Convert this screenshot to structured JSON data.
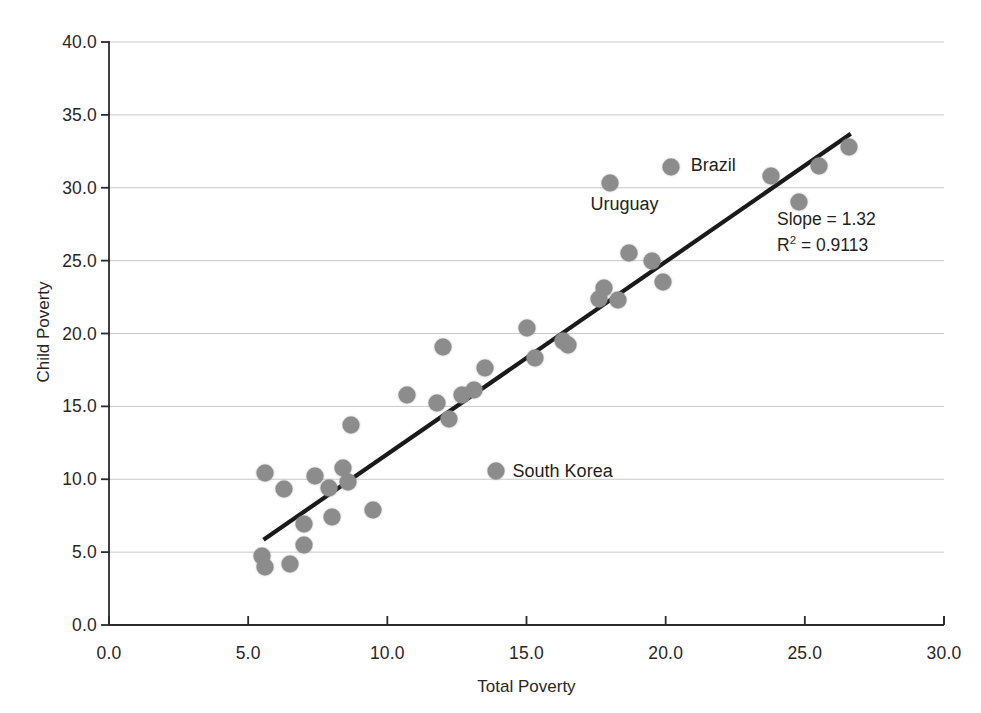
{
  "chart_data": {
    "type": "scatter",
    "title": "",
    "xlabel": "Total Poverty",
    "ylabel": "Child Poverty",
    "xlim": [
      0.0,
      30.0
    ],
    "ylim": [
      0.0,
      40.0
    ],
    "xticks": [
      "0.0",
      "5.0",
      "10.0",
      "15.0",
      "20.0",
      "25.0",
      "30.0"
    ],
    "yticks": [
      "0.0",
      "5.0",
      "10.0",
      "15.0",
      "20.0",
      "25.0",
      "30.0",
      "35.0",
      "40.0"
    ],
    "xtick_values": [
      0,
      5,
      10,
      15,
      20,
      25,
      30
    ],
    "ytick_values": [
      0,
      5,
      10,
      15,
      20,
      25,
      30,
      35,
      40
    ],
    "grid": "horizontal",
    "legend": "none",
    "marker_color": "#8c8c8c",
    "marker_size_px": 17,
    "trendline_color": "#1a1a1a",
    "series": [
      {
        "name": "Countries",
        "points": [
          {
            "x": 5.5,
            "y": 4.7,
            "label": ""
          },
          {
            "x": 5.6,
            "y": 4.0,
            "label": ""
          },
          {
            "x": 5.6,
            "y": 10.4,
            "label": ""
          },
          {
            "x": 6.3,
            "y": 9.3,
            "label": ""
          },
          {
            "x": 6.5,
            "y": 4.2,
            "label": ""
          },
          {
            "x": 7.0,
            "y": 6.9,
            "label": ""
          },
          {
            "x": 7.0,
            "y": 5.5,
            "label": ""
          },
          {
            "x": 7.4,
            "y": 10.2,
            "label": ""
          },
          {
            "x": 7.9,
            "y": 9.4,
            "label": ""
          },
          {
            "x": 8.0,
            "y": 7.4,
            "label": ""
          },
          {
            "x": 8.4,
            "y": 10.8,
            "label": ""
          },
          {
            "x": 8.6,
            "y": 9.8,
            "label": ""
          },
          {
            "x": 8.7,
            "y": 13.7,
            "label": ""
          },
          {
            "x": 9.5,
            "y": 7.9,
            "label": ""
          },
          {
            "x": 10.7,
            "y": 15.8,
            "label": ""
          },
          {
            "x": 11.8,
            "y": 15.2,
            "label": ""
          },
          {
            "x": 12.0,
            "y": 19.1,
            "label": ""
          },
          {
            "x": 12.2,
            "y": 14.1,
            "label": ""
          },
          {
            "x": 12.7,
            "y": 15.8,
            "label": ""
          },
          {
            "x": 13.1,
            "y": 16.1,
            "label": ""
          },
          {
            "x": 13.5,
            "y": 17.6,
            "label": ""
          },
          {
            "x": 13.9,
            "y": 10.6,
            "label": "South Korea"
          },
          {
            "x": 15.0,
            "y": 20.4,
            "label": ""
          },
          {
            "x": 15.3,
            "y": 18.3,
            "label": ""
          },
          {
            "x": 16.3,
            "y": 19.5,
            "label": ""
          },
          {
            "x": 16.5,
            "y": 19.2,
            "label": ""
          },
          {
            "x": 17.6,
            "y": 22.4,
            "label": ""
          },
          {
            "x": 17.8,
            "y": 23.1,
            "label": ""
          },
          {
            "x": 18.0,
            "y": 30.3,
            "label": "Uruguay"
          },
          {
            "x": 18.3,
            "y": 22.3,
            "label": ""
          },
          {
            "x": 18.7,
            "y": 25.5,
            "label": ""
          },
          {
            "x": 19.5,
            "y": 25.0,
            "label": ""
          },
          {
            "x": 19.9,
            "y": 23.5,
            "label": ""
          },
          {
            "x": 20.2,
            "y": 31.4,
            "label": "Brazil"
          },
          {
            "x": 23.8,
            "y": 30.8,
            "label": ""
          },
          {
            "x": 24.8,
            "y": 29.0,
            "label": ""
          },
          {
            "x": 25.5,
            "y": 31.5,
            "label": ""
          },
          {
            "x": 26.6,
            "y": 32.8,
            "label": ""
          }
        ]
      }
    ],
    "trendline": {
      "slope": 1.32,
      "x_start": 5.55,
      "y_start": 5.85,
      "x_end": 26.65,
      "y_end": 33.7
    },
    "annotations": [
      {
        "name": "slope-annotation",
        "text": "Slope = 1.32",
        "x": 24.0,
        "y": 27.8
      },
      {
        "name": "r-squared-annotation",
        "text_before": "R",
        "text_sup": "2",
        "text_after": " = 0.9113",
        "x": 24.0,
        "y": 26.0
      }
    ],
    "point_labels": [
      {
        "name": "brazil-label",
        "text": "Brazil",
        "x": 20.9,
        "y": 31.5
      },
      {
        "name": "uruguay-label",
        "text": "Uruguay",
        "x": 17.3,
        "y": 28.8
      },
      {
        "name": "south-korea-label",
        "text": "South Korea",
        "x": 14.5,
        "y": 10.5
      }
    ]
  }
}
